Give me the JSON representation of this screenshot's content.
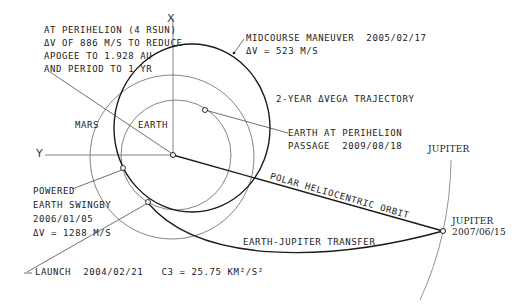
{
  "diagram": {
    "type": "orbit-trajectory",
    "axes": {
      "x_label": "X",
      "y_label": "Y"
    },
    "bodies": {
      "mars": "MARS",
      "earth": "EARTH",
      "jupiter_orbit": "JUPITER"
    },
    "annotations": {
      "perihelion": [
        "AT PERIHELION (4 RSUN)",
        "ΔV OF 886 M/S TO REDUCE",
        "APOGEE TO 1.928 AU",
        "AND PERIOD TO 1 YR"
      ],
      "midcourse": [
        "MIDCOURSE MANEUVER  2005/02/17",
        "ΔV = 523 M/S"
      ],
      "trajectory": "2-YEAR ΔVEGA TRAJECTORY",
      "earth_perihelion": [
        "EARTH AT PERIHELION",
        "PASSAGE  2009/08/18"
      ],
      "swingby": [
        "POWERED",
        "EARTH SWINGBY",
        "2006/01/05",
        "ΔV = 1288 M/S"
      ],
      "polar_orbit": "POLAR HELIOCENTRIC ORBIT",
      "transfer": "EARTH-JUPITER TRANSFER",
      "launch": "LAUNCH  2004/02/21   C3 = 25.75 KM²/S²",
      "jupiter_arrival": [
        "JUPITER",
        "2007/06/15"
      ]
    },
    "colors": {
      "line": "#1a1a1a",
      "thin": "#555555",
      "background": "#ffffff"
    }
  }
}
